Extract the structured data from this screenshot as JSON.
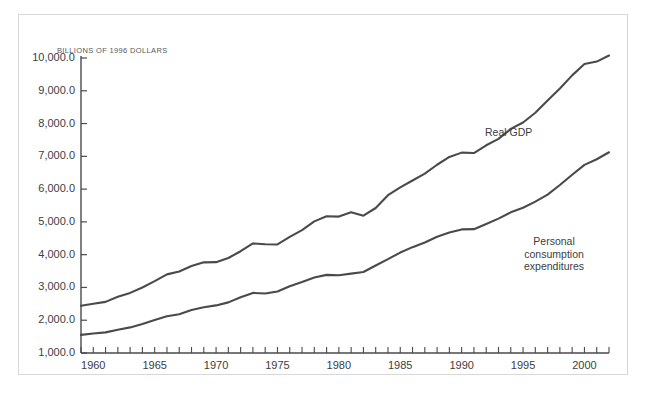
{
  "figure": {
    "axis_unit_label": "BILLIONS OF 1996 DOLLARS",
    "frame_color": "#d8d8d8",
    "background": "#ffffff"
  },
  "chart_data": {
    "type": "line",
    "title": "",
    "subtitle": "",
    "xlabel": "",
    "ylabel": "BILLIONS OF 1996 DOLLARS",
    "xlim": [
      1959,
      2002
    ],
    "ylim": [
      1000,
      10000
    ],
    "grid": false,
    "legend_position": "inline-annotation",
    "ytick_labels": [
      "1,000.0",
      "2,000.0",
      "3,000.0",
      "4,000.0",
      "5,000.0",
      "6,000.0",
      "7,000.0",
      "8,000.0",
      "9,000.0",
      "10,000.0"
    ],
    "ytick_values": [
      1000,
      2000,
      3000,
      4000,
      5000,
      6000,
      7000,
      8000,
      9000,
      10000
    ],
    "xtick_labels": [
      "1960",
      "1965",
      "1970",
      "1975",
      "1980",
      "1985",
      "1990",
      "1995",
      "2000"
    ],
    "xtick_values": [
      1960,
      1965,
      1970,
      1975,
      1980,
      1985,
      1990,
      1995,
      2000
    ],
    "x_minor_tick_interval": 1,
    "line_color": "#4a4a4c",
    "line_width": 2.1,
    "x": [
      1959,
      1960,
      1961,
      1962,
      1963,
      1964,
      1965,
      1966,
      1967,
      1968,
      1969,
      1970,
      1971,
      1972,
      1973,
      1974,
      1975,
      1976,
      1977,
      1978,
      1979,
      1980,
      1981,
      1982,
      1983,
      1984,
      1985,
      1986,
      1987,
      1988,
      1989,
      1990,
      1991,
      1992,
      1993,
      1994,
      1995,
      1996,
      1997,
      1998,
      1999,
      2000,
      2001,
      2002
    ],
    "series": [
      {
        "name": "Real GDP",
        "annotation": "Real GDP",
        "values": [
          2442,
          2502,
          2560,
          2715,
          2834,
          2999,
          3192,
          3399,
          3485,
          3653,
          3766,
          3772,
          3899,
          4105,
          4342,
          4320,
          4311,
          4541,
          4751,
          5015,
          5173,
          5162,
          5292,
          5189,
          5424,
          5814,
          6054,
          6264,
          6475,
          6743,
          6981,
          7113,
          7101,
          7337,
          7533,
          7836,
          8032,
          8329,
          8704,
          9067,
          9470,
          9817,
          9891,
          10075
        ]
      },
      {
        "name": "Personal consumption expenditures",
        "annotation": "Personal\nconsumption\nexpenditures",
        "values": [
          1554,
          1597,
          1630,
          1711,
          1781,
          1888,
          2008,
          2121,
          2185,
          2310,
          2397,
          2452,
          2545,
          2702,
          2834,
          2813,
          2877,
          3035,
          3164,
          3303,
          3384,
          3374,
          3422,
          3470,
          3669,
          3863,
          4064,
          4229,
          4370,
          4547,
          4676,
          4771,
          4778,
          4934,
          5099,
          5291,
          5433,
          5619,
          5832,
          6126,
          6439,
          6739,
          6910,
          7124
        ]
      }
    ]
  }
}
